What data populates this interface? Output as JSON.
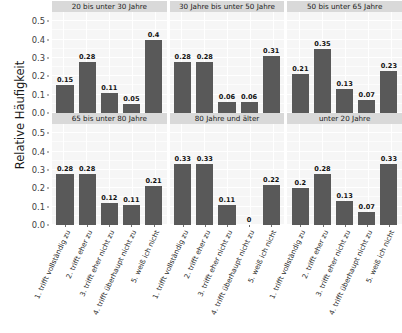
{
  "chart_data": {
    "type": "bar",
    "title": "",
    "xlabel": "",
    "ylabel": "Relative Häufigkeit",
    "ylim": [
      0,
      0.55
    ],
    "grid": true,
    "legend": "none",
    "facet_layout": "2 rows x 3 columns",
    "categories": [
      "1. trifft vollständig zu",
      "2. trifft eher zu",
      "3. trifft eher nicht zu",
      "4. trifft überhaupt nicht zu",
      "5. weiß ich nicht"
    ],
    "ytick_labels": [
      "0.0",
      "0.1",
      "0.2",
      "0.3",
      "0.4",
      "0.5"
    ],
    "ytick_values": [
      0.0,
      0.1,
      0.2,
      0.3,
      0.4,
      0.5
    ],
    "bar_color": "#595959",
    "panel_background": "#f6f6f6",
    "strip_background": "#d9d9d9",
    "gridline_color": "#ffffff",
    "panels": [
      {
        "strip": "20 bis unter 30 Jahre",
        "values": [
          0.15,
          0.28,
          0.11,
          0.05,
          0.4
        ],
        "labels": [
          "0.15",
          "0.28",
          "0.11",
          "0.05",
          "0.4"
        ]
      },
      {
        "strip": "30 Jahre bis unter 50 Jahre",
        "values": [
          0.28,
          0.28,
          0.06,
          0.06,
          0.31
        ],
        "labels": [
          "0.28",
          "0.28",
          "0.06",
          "0.06",
          "0.31"
        ]
      },
      {
        "strip": "50 bis unter 65 Jahre",
        "values": [
          0.21,
          0.35,
          0.13,
          0.07,
          0.23
        ],
        "labels": [
          "0.21",
          "0.35",
          "0.13",
          "0.07",
          "0.23"
        ]
      },
      {
        "strip": "65 bis unter 80 Jahre",
        "values": [
          0.28,
          0.28,
          0.12,
          0.11,
          0.21
        ],
        "labels": [
          "0.28",
          "0.28",
          "0.12",
          "0.11",
          "0.21"
        ]
      },
      {
        "strip": "80 Jahre und älter",
        "values": [
          0.33,
          0.33,
          0.11,
          0,
          0.22
        ],
        "labels": [
          "0.33",
          "0.33",
          "0.11",
          "0",
          "0.22"
        ]
      },
      {
        "strip": "unter 20 Jahre",
        "values": [
          0.2,
          0.28,
          0.13,
          0.07,
          0.33
        ],
        "labels": [
          "0.2",
          "0.28",
          "0.13",
          "0.07",
          "0.33"
        ]
      }
    ]
  }
}
